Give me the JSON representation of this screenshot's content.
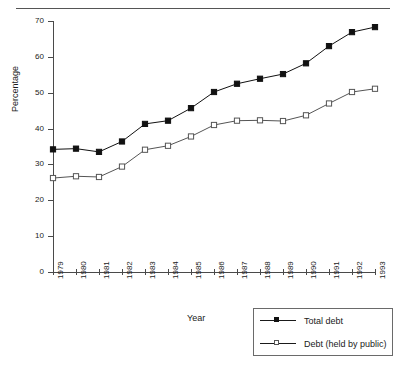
{
  "chart_data": {
    "type": "line",
    "title": "",
    "xlabel": "Year",
    "ylabel": "Percentage",
    "categories": [
      "1979",
      "1980",
      "1981",
      "1982",
      "1983",
      "1984",
      "1985",
      "1986",
      "1987",
      "1988",
      "1989",
      "1990",
      "1991",
      "1992",
      "1993"
    ],
    "xlim": [
      1979,
      1993
    ],
    "ylim": [
      0,
      70
    ],
    "yticks": [
      0,
      10,
      20,
      30,
      40,
      50,
      60,
      70
    ],
    "ytick_labels": [
      "0",
      "10",
      "20",
      "30",
      "40",
      "50",
      "60",
      "70"
    ],
    "grid": false,
    "legend_position": "bottom-right",
    "series": [
      {
        "name": "Total debt",
        "marker": "filled-square",
        "color": "#111111",
        "values": [
          34.2,
          34.4,
          33.5,
          36.4,
          41.3,
          42.2,
          45.7,
          50.2,
          52.5,
          53.9,
          55.2,
          58.2,
          63.0,
          66.9,
          68.3
        ]
      },
      {
        "name": "Debt (held by public)",
        "marker": "open-square",
        "color": "#555555",
        "values": [
          26.2,
          26.7,
          26.5,
          29.4,
          34.1,
          35.2,
          37.8,
          41.0,
          42.2,
          42.3,
          42.1,
          43.7,
          47.0,
          50.2,
          51.1
        ]
      }
    ]
  },
  "legend": {
    "items": [
      {
        "label": "Total debt"
      },
      {
        "label": "Debt (held by public)"
      }
    ]
  }
}
